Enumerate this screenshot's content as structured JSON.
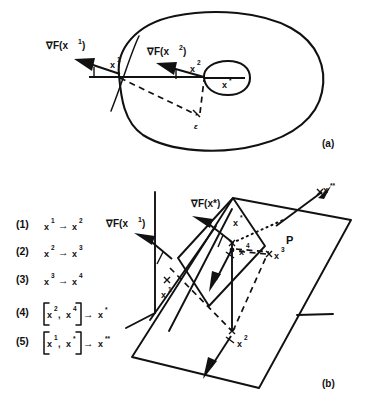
{
  "figure": {
    "panels": [
      {
        "id": "a",
        "label": "(a)",
        "caption_label": "(a)",
        "labels": {
          "grad_x1": "∇F(x",
          "grad_x1_sup": "1",
          "grad_x1_close": ")",
          "grad_x2": "∇F(x",
          "grad_x2_sup": "2",
          "grad_x2_close": ")",
          "point_x1": "x",
          "point_x1_sup": "1",
          "point_x2": "x",
          "point_x2_sup": "2",
          "point_xstar": "x",
          "point_xstar_sup": "*",
          "epsilon": "ε"
        }
      },
      {
        "id": "b",
        "label": "(b)",
        "caption_label": "(b)",
        "labels": {
          "grad_x1": "∇F(x",
          "grad_x1_sup": "1",
          "grad_x1_close": ")",
          "grad_xstar": "∇F(x*)",
          "point_x1": "x",
          "point_x1_sup": "1",
          "point_x2": "x",
          "point_x2_sup": "2",
          "point_x3": "x",
          "point_x3_sup": "3",
          "point_x4": "x",
          "point_x4_sup": "4",
          "point_xstar": "x",
          "point_xstar_sup": "*",
          "point_xstarstar": "x",
          "point_xstarstar_sup": "**",
          "plane": "P"
        }
      }
    ],
    "steps": [
      {
        "number": "(1)",
        "kind": "simple",
        "from_base": "x",
        "from_sup": "1",
        "arrow": "→",
        "to_base": "x",
        "to_sup": "2"
      },
      {
        "number": "(2)",
        "kind": "simple",
        "from_base": "x",
        "from_sup": "2",
        "arrow": "→",
        "to_base": "x",
        "to_sup": "3"
      },
      {
        "number": "(3)",
        "kind": "simple",
        "from_base": "x",
        "from_sup": "3",
        "arrow": "→",
        "to_base": "x",
        "to_sup": "4"
      },
      {
        "number": "(4)",
        "kind": "bracket",
        "first_base": "x",
        "first_sup": "2",
        "comma": ",",
        "second_base": "x",
        "second_sup": "4",
        "arrow": "→",
        "result_base": "x",
        "result_sup": "*"
      },
      {
        "number": "(5)",
        "kind": "bracket",
        "first_base": "x",
        "first_sup": "1",
        "comma": ",",
        "second_base": "x",
        "second_sup": "*",
        "arrow": "→",
        "result_base": "x",
        "result_sup": "**"
      }
    ],
    "colors": {
      "ink": "#111111",
      "background": "#ffffff"
    }
  }
}
